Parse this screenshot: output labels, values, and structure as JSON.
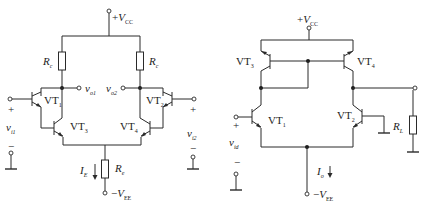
{
  "figure": {
    "colors": {
      "line": "#2a2a2a",
      "background": "#ffffff"
    },
    "left_circuit": {
      "name": "Darlington differential amplifier",
      "supply_pos": {
        "sym": "V",
        "sub": "CC",
        "prefix": "+"
      },
      "supply_neg": {
        "sym": "V",
        "sub": "EE",
        "prefix": "−"
      },
      "collector_resistor_left": {
        "sym": "R",
        "sub": "c"
      },
      "collector_resistor_right": {
        "sym": "R",
        "sub": "c"
      },
      "emitter_resistor": {
        "sym": "R",
        "sub": "e"
      },
      "tail_current": {
        "sym": "I",
        "sub": "E"
      },
      "outputs": [
        {
          "sym": "v",
          "sub": "o1"
        },
        {
          "sym": "v",
          "sub": "o2"
        }
      ],
      "inputs": [
        {
          "sym": "v",
          "sub": "i1",
          "plus": "+",
          "minus": "−"
        },
        {
          "sym": "v",
          "sub": "i2",
          "plus": "+",
          "minus": "−"
        }
      ],
      "transistors": [
        {
          "sym": "VT",
          "sub": "1"
        },
        {
          "sym": "VT",
          "sub": "2"
        },
        {
          "sym": "VT",
          "sub": "3"
        },
        {
          "sym": "VT",
          "sub": "4"
        }
      ]
    },
    "right_circuit": {
      "name": "Differential amplifier with current-mirror active load",
      "supply_pos": {
        "sym": "V",
        "sub": "CC",
        "prefix": "+"
      },
      "supply_neg": {
        "sym": "V",
        "sub": "EE",
        "prefix": "−"
      },
      "tail_current": {
        "sym": "I",
        "sub": "o"
      },
      "load_resistor": {
        "sym": "R",
        "sub": "L"
      },
      "input": {
        "sym": "v",
        "sub": "id",
        "plus": "+",
        "minus": "−"
      },
      "transistors": [
        {
          "sym": "VT",
          "sub": "1"
        },
        {
          "sym": "VT",
          "sub": "2"
        },
        {
          "sym": "VT",
          "sub": "3"
        },
        {
          "sym": "VT",
          "sub": "4"
        }
      ]
    }
  }
}
